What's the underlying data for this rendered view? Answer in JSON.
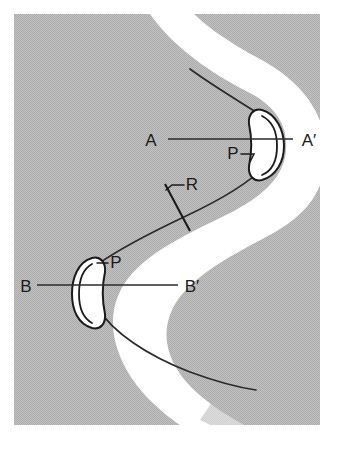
{
  "figure": {
    "kind": "structural-geology-fold-map",
    "canvas": {
      "width": 341,
      "height": 451
    },
    "colors": {
      "background": "#ffffff",
      "country_rock_gray": "#b9b9b9",
      "folded_layer_white": "#ffffff",
      "line_ink": "#1b1b1b",
      "section_line": "#2b2b2b"
    }
  },
  "labels": {
    "section_a": "A",
    "section_a_prime": "A′",
    "section_b": "B",
    "section_b_prime": "B′",
    "hinge_upper": "P",
    "hinge_lower": "P",
    "limb": "R"
  },
  "annotations": [
    {
      "name": "section-line-aa",
      "from": "A",
      "to": "A′",
      "y": 139
    },
    {
      "name": "section-line-bb",
      "from": "B",
      "to": "B′",
      "y": 285
    },
    {
      "name": "hinge-marker-upper",
      "label": "P"
    },
    {
      "name": "hinge-marker-lower",
      "label": "P"
    },
    {
      "name": "limb-marker",
      "label": "R"
    }
  ]
}
